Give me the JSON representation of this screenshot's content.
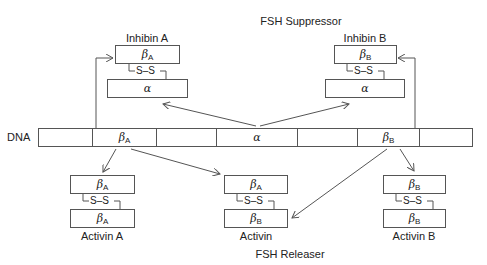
{
  "titles": {
    "top": "FSH Suppressor",
    "bottom": "FSH Releaser"
  },
  "dna": {
    "label": "DNA",
    "segments": [
      {
        "greek": "",
        "sub": ""
      },
      {
        "greek": "β",
        "sub": "A"
      },
      {
        "greek": "",
        "sub": ""
      },
      {
        "greek": "α",
        "sub": ""
      },
      {
        "greek": "",
        "sub": ""
      },
      {
        "greek": "β",
        "sub": "B"
      },
      {
        "greek": "",
        "sub": ""
      }
    ]
  },
  "bond_label": "S–S",
  "inhibins": [
    {
      "name": "Inhibin A",
      "top": {
        "greek": "β",
        "sub": "A"
      },
      "bottom": {
        "greek": "α",
        "sub": ""
      }
    },
    {
      "name": "Inhibin B",
      "top": {
        "greek": "β",
        "sub": "B"
      },
      "bottom": {
        "greek": "α",
        "sub": ""
      }
    }
  ],
  "activins": [
    {
      "name": "Activin A",
      "top": {
        "greek": "β",
        "sub": "A"
      },
      "bottom": {
        "greek": "β",
        "sub": "A"
      }
    },
    {
      "name": "Activin",
      "top": {
        "greek": "β",
        "sub": "A"
      },
      "bottom": {
        "greek": "β",
        "sub": "B"
      }
    },
    {
      "name": "Activin B",
      "top": {
        "greek": "β",
        "sub": "B"
      },
      "bottom": {
        "greek": "β",
        "sub": "B"
      }
    }
  ],
  "colors": {
    "line": "#555555",
    "text": "#222222",
    "background": "#ffffff"
  }
}
